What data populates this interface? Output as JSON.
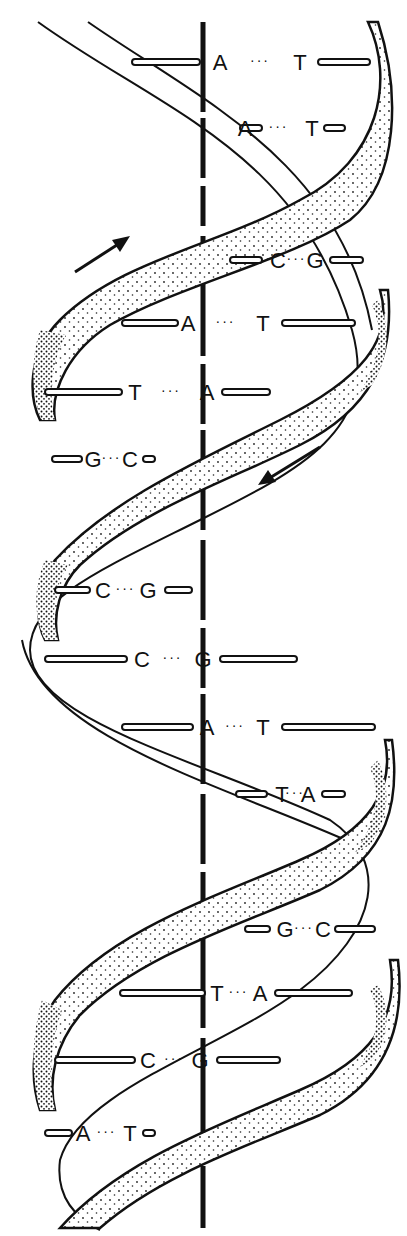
{
  "diagram": {
    "colors": {
      "ink": "#111111",
      "background": "#ffffff",
      "stipple": "#222222"
    },
    "axis": {
      "x": 203,
      "y_top": 22,
      "y_bottom": 1228
    },
    "arrows": [
      {
        "name": "strand-direction-up-arrow",
        "x1": 75,
        "y1": 272,
        "x2": 128,
        "y2": 238,
        "direction": "up-right"
      },
      {
        "name": "strand-direction-down-arrow",
        "x1": 320,
        "y1": 447,
        "x2": 259,
        "y2": 484,
        "direction": "down-left"
      }
    ],
    "base_pairs": [
      {
        "left": "A",
        "right": "T",
        "y": 62,
        "lx": 220,
        "rx": 300,
        "l_bar": [
          132,
          200
        ],
        "r_bar": [
          318,
          370
        ]
      },
      {
        "left": "A",
        "right": "T",
        "y": 128,
        "lx": 245,
        "rx": 312,
        "l_bar": [
          240,
          262
        ],
        "r_bar": [
          324,
          345
        ]
      },
      {
        "left": "C",
        "right": "G",
        "y": 260,
        "lx": 278,
        "rx": 315,
        "l_bar": [
          230,
          262
        ],
        "r_bar": [
          330,
          363
        ]
      },
      {
        "left": "A",
        "right": "T",
        "y": 323,
        "lx": 188,
        "rx": 263,
        "l_bar": [
          122,
          178
        ],
        "r_bar": [
          282,
          355
        ]
      },
      {
        "left": "T",
        "right": "A",
        "y": 392,
        "lx": 135,
        "rx": 207,
        "l_bar": [
          45,
          122
        ],
        "r_bar": [
          222,
          270
        ]
      },
      {
        "left": "G",
        "right": "C",
        "y": 459,
        "lx": 93,
        "rx": 130,
        "l_bar": [
          52,
          82
        ],
        "r_bar": [
          143,
          155
        ]
      },
      {
        "left": "C",
        "right": "G",
        "y": 590,
        "lx": 103,
        "rx": 148,
        "l_bar": [
          55,
          90
        ],
        "r_bar": [
          165,
          192
        ]
      },
      {
        "left": "C",
        "right": "G",
        "y": 659,
        "lx": 142,
        "rx": 203,
        "l_bar": [
          45,
          127
        ],
        "r_bar": [
          220,
          297
        ]
      },
      {
        "left": "A",
        "right": "T",
        "y": 727,
        "lx": 207,
        "rx": 263,
        "l_bar": [
          122,
          193
        ],
        "r_bar": [
          282,
          375
        ]
      },
      {
        "left": "T",
        "right": "A",
        "y": 794,
        "lx": 282,
        "rx": 308,
        "l_bar": [
          236,
          267
        ],
        "r_bar": [
          322,
          345
        ]
      },
      {
        "left": "G",
        "right": "C",
        "y": 929,
        "lx": 285,
        "rx": 323,
        "l_bar": [
          245,
          270
        ],
        "r_bar": [
          335,
          375
        ]
      },
      {
        "left": "T",
        "right": "A",
        "y": 993,
        "lx": 217,
        "rx": 260,
        "l_bar": [
          120,
          205
        ],
        "r_bar": [
          275,
          352
        ]
      },
      {
        "left": "C",
        "right": "G",
        "y": 1060,
        "lx": 148,
        "rx": 200,
        "l_bar": [
          55,
          135
        ],
        "r_bar": [
          217,
          280
        ]
      },
      {
        "left": "A",
        "right": "T",
        "y": 1133,
        "lx": 83,
        "rx": 130,
        "l_bar": [
          45,
          72
        ],
        "r_bar": [
          143,
          155
        ]
      }
    ],
    "hydrogen_bond_dots": "···"
  }
}
